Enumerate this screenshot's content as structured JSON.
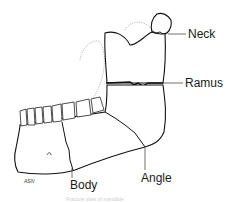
{
  "figure": {
    "labels": {
      "neck": "Neck",
      "ramus": "Ramus",
      "body": "Body",
      "angle": "Angle"
    },
    "signature": "ASN",
    "caption": "Fracture sites of mandible"
  }
}
